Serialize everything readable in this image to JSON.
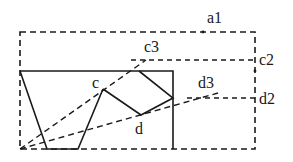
{
  "diagram": {
    "labels": {
      "a1": "a1",
      "c3": "c3",
      "c2": "c2",
      "d3": "d3",
      "d2": "d2",
      "c": "c",
      "d": "d"
    },
    "colors": {
      "stroke": "#1a1a1a",
      "background": "#ffffff"
    }
  }
}
